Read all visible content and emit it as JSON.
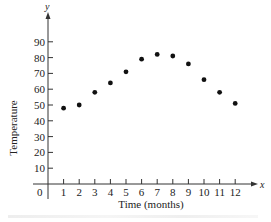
{
  "chart_data": {
    "type": "scatter",
    "title": "",
    "xlabel": "Time (months)",
    "ylabel": "Temperature",
    "x_axis_var": "x",
    "y_axis_var": "y",
    "origin_label": "0",
    "x": [
      1,
      2,
      3,
      4,
      5,
      6,
      7,
      8,
      9,
      10,
      11,
      12
    ],
    "values": [
      48,
      50,
      58,
      64,
      71,
      79,
      82,
      81,
      76,
      66,
      58,
      51
    ],
    "xticks": [
      "1",
      "2",
      "3",
      "4",
      "5",
      "6",
      "7",
      "8",
      "9",
      "10",
      "11",
      "12"
    ],
    "yticks": [
      "10",
      "20",
      "30",
      "40",
      "50",
      "60",
      "70",
      "80",
      "90"
    ],
    "xlim": [
      0,
      12
    ],
    "ylim": [
      0,
      90
    ],
    "grid": false,
    "legend": null,
    "marker_color": "#111111"
  }
}
